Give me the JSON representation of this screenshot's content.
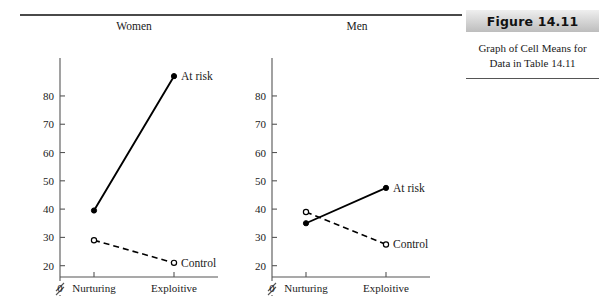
{
  "figure": {
    "header_label": "Figure 14.11",
    "caption_line1": "Graph of Cell Means for",
    "caption_line2": "Data in Table 14.11"
  },
  "chart_data": [
    {
      "type": "line",
      "title": "Women",
      "xlabel": "",
      "ylabel": "",
      "categories": [
        "Nurturing",
        "Exploitive"
      ],
      "origin_label": "0",
      "yticks": [
        20,
        30,
        40,
        50,
        60,
        70,
        80
      ],
      "ylim": [
        16,
        92
      ],
      "axis_break": true,
      "grid": false,
      "legend": "inline-endpoint-labels",
      "series": [
        {
          "name": "At risk",
          "values": [
            39.5,
            87.0
          ],
          "style": "solid",
          "marker": "filled-circle",
          "label": "At risk"
        },
        {
          "name": "Control",
          "values": [
            29.0,
            21.0
          ],
          "style": "dashed",
          "marker": "open-circle",
          "label": "Control"
        }
      ]
    },
    {
      "type": "line",
      "title": "Men",
      "xlabel": "",
      "ylabel": "",
      "categories": [
        "Nurturing",
        "Exploitive"
      ],
      "origin_label": "0",
      "yticks": [
        20,
        30,
        40,
        50,
        60,
        70,
        80
      ],
      "ylim": [
        16,
        92
      ],
      "axis_break": true,
      "grid": false,
      "legend": "inline-endpoint-labels",
      "series": [
        {
          "name": "At risk",
          "values": [
            35.0,
            47.5
          ],
          "style": "solid",
          "marker": "filled-circle",
          "label": "At risk"
        },
        {
          "name": "Control",
          "values": [
            39.0,
            27.5
          ],
          "style": "dashed",
          "marker": "open-circle",
          "label": "Control"
        }
      ]
    }
  ],
  "colors": {
    "ink": "#000000",
    "axis": "#555555",
    "rule": "#4a4a4a",
    "header_bg_light": "#efefef",
    "header_bg_dark": "#bdbdbd"
  }
}
